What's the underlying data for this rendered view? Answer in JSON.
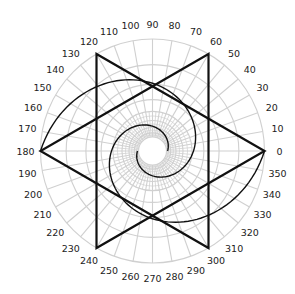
{
  "chart_data": {
    "type": "polar",
    "title": "",
    "center": [
      152.5,
      151
    ],
    "outer_radius": 112,
    "angle_ticks": [
      0,
      10,
      20,
      30,
      40,
      50,
      60,
      70,
      80,
      90,
      100,
      110,
      120,
      130,
      140,
      150,
      160,
      170,
      180,
      190,
      200,
      210,
      220,
      230,
      240,
      250,
      260,
      270,
      280,
      290,
      300,
      310,
      320,
      330,
      340,
      350
    ],
    "grid": {
      "ring_count": 8,
      "spoke_step_deg": 10,
      "inner_spoke_step_deg": 5,
      "color": "#d0d0d0"
    },
    "series": [
      {
        "name": "hexagram",
        "kind": "polygon-star",
        "vertices_deg": [
          0,
          60,
          120,
          180,
          240,
          300
        ],
        "triangles": [
          [
            0,
            120,
            240
          ],
          [
            60,
            180,
            300
          ]
        ],
        "radius_fraction": 1.0,
        "color": "#111111"
      },
      {
        "name": "double-spiral",
        "kind": "logarithmic-spiral",
        "arms": 2,
        "start_radius": 15,
        "end_radius": 112,
        "turns": 1,
        "arm_start_deg": [
          180,
          0
        ],
        "color": "#111111"
      }
    ],
    "grid_on": true,
    "legend": null
  }
}
